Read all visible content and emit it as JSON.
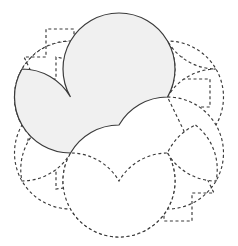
{
  "figure": {
    "background_color": "#ffffff",
    "canvas": {
      "width": 238,
      "height": 246
    },
    "center": {
      "x": 119,
      "y": 125
    },
    "petal_count": 6,
    "petal_radius": 56,
    "tip_radius": 112,
    "shaded_fill": "#f0f0f0",
    "stroke_color": "#3a3a3a",
    "dashed_stroke_width": 1.15,
    "solid_stroke_width": 1.2,
    "dash_pattern": "3 2.6",
    "petals": [
      {
        "name": "petal-top-left",
        "angle_deg": 210,
        "style": "dashed",
        "center": {
          "x": 70.5,
          "y": 97
        }
      },
      {
        "name": "petal-top-right",
        "angle_deg": 270,
        "style": "dashed",
        "center": {
          "x": 167.5,
          "y": 97
        }
      },
      {
        "name": "petal-right",
        "angle_deg": 330,
        "style": "dashed",
        "center": {
          "x": 167.5,
          "y": 153
        }
      },
      {
        "name": "petal-bottom-right",
        "angle_deg": 30,
        "style": "dashed",
        "center": {
          "x": 119,
          "y": 181
        }
      },
      {
        "name": "petal-bottom-left",
        "angle_deg": 90,
        "style": "dashed",
        "center": {
          "x": 70.5,
          "y": 153
        }
      },
      {
        "name": "petal-left",
        "angle_deg": 150,
        "style": "dashed",
        "center": {
          "x": 119,
          "y": 69
        }
      }
    ],
    "spikes": [
      {
        "name": "spike-top",
        "tip": {
          "x": 119,
          "y": 13
        },
        "style": "shaded"
      },
      {
        "name": "spike-upper-left",
        "tip": {
          "x": 22,
          "y": 69
        },
        "style": "shaded"
      },
      {
        "name": "spike-upper-right",
        "tip": {
          "x": 216,
          "y": 69
        },
        "style": "dashed"
      },
      {
        "name": "spike-right",
        "tip": {
          "x": 216,
          "y": 181
        },
        "style": "dashed"
      },
      {
        "name": "spike-bottom",
        "tip": {
          "x": 119,
          "y": 237
        },
        "style": "dashed"
      },
      {
        "name": "spike-lower-left",
        "tip": {
          "x": 22,
          "y": 181
        },
        "style": "dashed"
      }
    ],
    "notch": {
      "description": "rectangular step cut into the outer edge of each petal",
      "depth": 20,
      "width": 20
    }
  }
}
